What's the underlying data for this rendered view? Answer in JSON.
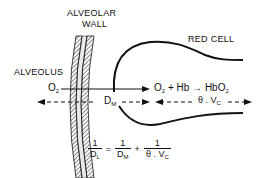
{
  "labels": {
    "alveolar_wall_line1": "ALVEOLAR",
    "alveolar_wall_line2": "WALL",
    "red_cell": "RED CELL",
    "alveolus": "ALVEOLUS",
    "o2": "O",
    "o2_sub": "2"
  },
  "reaction": {
    "o2": "O",
    "o2_sub": "2",
    "plus": "+",
    "hb": "Hb",
    "arrow": "→",
    "product": "HbO",
    "product_sub": "2"
  },
  "dimensions": {
    "dm": "D",
    "dm_sub": "M",
    "theta_vc": "θ . V",
    "theta_vc_sub": "C"
  },
  "equation": {
    "lhs_num": "1",
    "lhs_den": "D",
    "lhs_den_sub": "L",
    "equals": "=",
    "term1_num": "1",
    "term1_den": "D",
    "term1_den_sub": "M",
    "plus": "+",
    "term2_num": "1",
    "term2_den": "θ . V",
    "term2_den_sub": "C"
  }
}
